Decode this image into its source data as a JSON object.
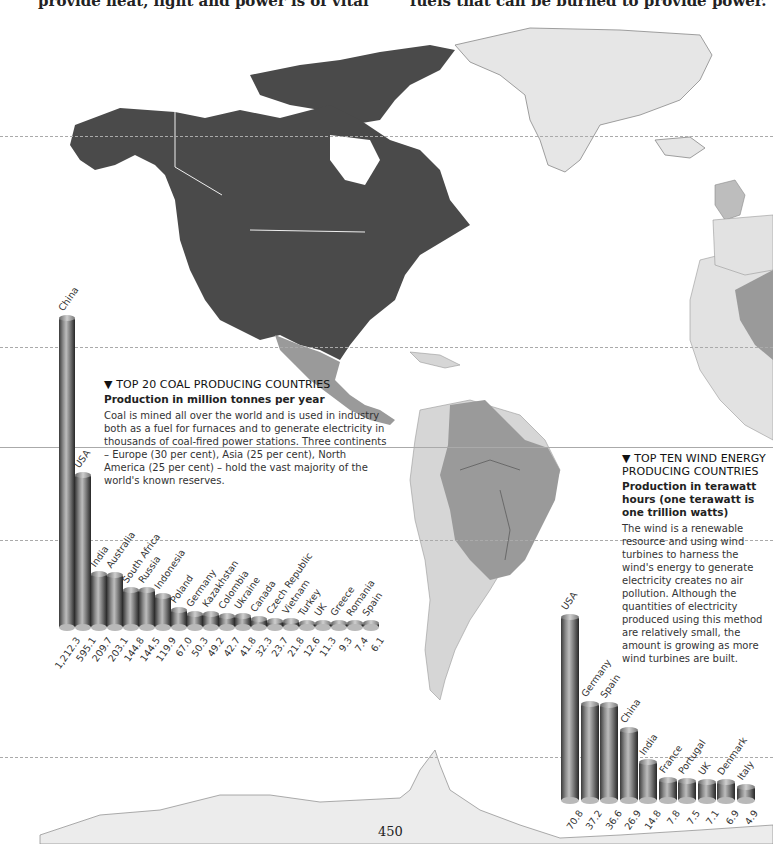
{
  "header": {
    "left_text": "provide heat, light and power is of vital",
    "right_text": "fuels that can be burned to provide power."
  },
  "page_number": "450",
  "colors": {
    "north_america": "#4a4a4a",
    "latin_america_dark": "#9a9a9a",
    "latin_america_light": "#d6d6d6",
    "greenland": "#e4e4e4",
    "antarctica": "#ececec",
    "guide_line": "#aaaaaa"
  },
  "coal_caption": {
    "title": "▼ TOP 20 COAL PRODUCING COUNTRIES",
    "subtitle": "Production in million tonnes per year",
    "body": "Coal is mined all over the world and is used in industry both as a fuel for furnaces and to generate electricity in thousands of coal-fired power stations. Three continents – Europe (30 per cent), Asia (25 per cent), North America (25 per cent) – hold the vast majority of the world's known reserves."
  },
  "wind_caption": {
    "title": "▼ TOP TEN WIND ENERGY PRODUCING COUNTRIES",
    "subtitle": "Production in terawatt hours (one terawatt is one trillion watts)",
    "body": "The wind is a renewable resource and using wind turbines to harness the wind's energy to generate electricity creates no air pollution. Although the quantities of electricity produced using this method are relatively small, the amount is growing as more wind turbines are built."
  },
  "chart_data": [
    {
      "type": "bar",
      "title": "TOP 20 COAL PRODUCING COUNTRIES",
      "subtitle": "Production in million tonnes per year",
      "xlabel": "",
      "ylabel": "Million tonnes per year",
      "grid": false,
      "legend": "none",
      "categories": [
        "China",
        "USA",
        "India",
        "Australia",
        "South Africa",
        "Russia",
        "Indonesia",
        "Poland",
        "Germany",
        "Kazakhstan",
        "Colombia",
        "Ukraine",
        "Canada",
        "Czech Republic",
        "Vietnam",
        "Turkey",
        "UK",
        "Greece",
        "Romania",
        "Spain"
      ],
      "values": [
        1212.3,
        595.1,
        209.7,
        203.1,
        144.8,
        144.5,
        119.9,
        67.0,
        50.3,
        49.2,
        42.7,
        41.8,
        32.3,
        23.7,
        21.8,
        12.6,
        11.3,
        9.3,
        7.4,
        6.1
      ],
      "value_labels": [
        "1,212.3",
        "595.1",
        "209.7",
        "203.1",
        "144.8",
        "144.5",
        "119.9",
        "67.0",
        "50.3",
        "49.2",
        "42.7",
        "41.8",
        "32.3",
        "23.7",
        "21.8",
        "12.6",
        "11.3",
        "9.3",
        "7.4",
        "6.1"
      ],
      "ylim": [
        0,
        1212.3
      ]
    },
    {
      "type": "bar",
      "title": "TOP TEN WIND ENERGY PRODUCING COUNTRIES",
      "subtitle": "Production in terawatt hours (one terawatt is one trillion watts)",
      "xlabel": "",
      "ylabel": "Terawatt hours",
      "grid": false,
      "legend": "none",
      "categories": [
        "USA",
        "Germany",
        "Spain",
        "China",
        "India",
        "France",
        "Portugal",
        "UK",
        "Denmark",
        "Italy"
      ],
      "values": [
        70.8,
        37.2,
        36.6,
        26.9,
        14.8,
        7.8,
        7.5,
        7.1,
        6.9,
        4.9
      ],
      "value_labels": [
        "70.8",
        "37.2",
        "36.6",
        "26.9",
        "14.8",
        "7.8",
        "7.5",
        "7.1",
        "6.9",
        "4.9"
      ],
      "ylim": [
        0,
        70.8
      ]
    }
  ]
}
